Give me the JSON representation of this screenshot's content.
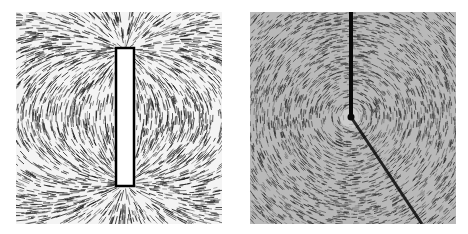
{
  "figure": {
    "panels": [
      {
        "id": "left",
        "subject": "iron filings around a bar magnet",
        "background": "#f4f4f4",
        "filing_color": "#1a1a1a",
        "magnet_color": "#ffffff"
      },
      {
        "id": "right",
        "subject": "iron filings around a current-carrying wire",
        "background": "#b9b9b9",
        "filing_color": "#2a2a2a",
        "wire_color": "#0a0a0a"
      }
    ]
  }
}
